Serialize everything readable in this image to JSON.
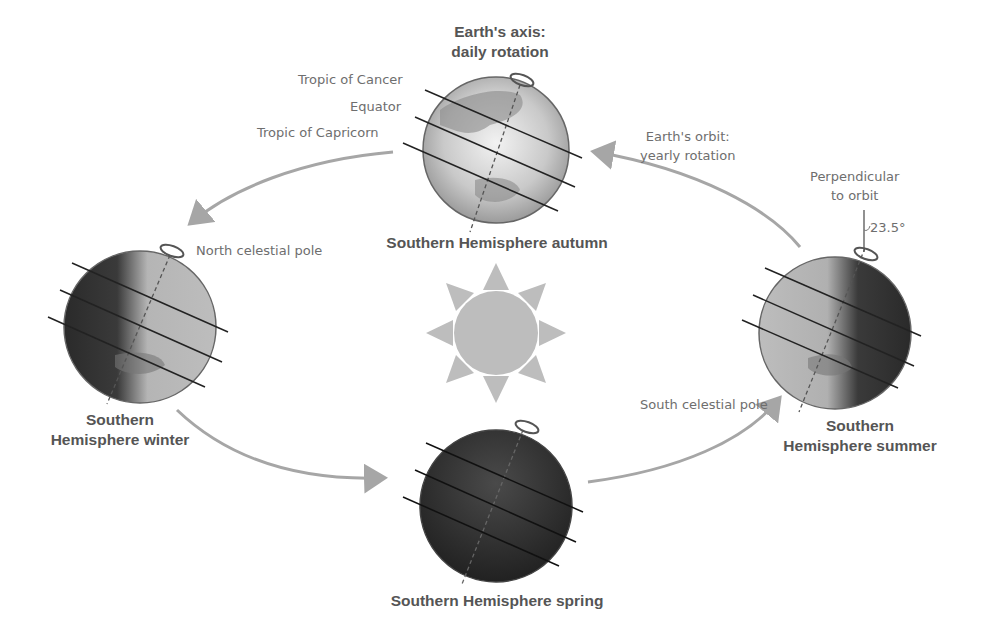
{
  "diagram": {
    "title_axis": [
      "Earth's axis:",
      "daily rotation"
    ],
    "orbit_label": [
      "Earth's orbit:",
      "yearly rotation"
    ],
    "perpendicular_label": [
      "Perpendicular",
      "to orbit"
    ],
    "tilt_angle": "23.5°",
    "latitude_labels": {
      "tropic_cancer": "Tropic of Cancer",
      "equator": "Equator",
      "tropic_capricorn": "Tropic of Capricorn"
    },
    "pole_labels": {
      "north": "North celestial pole",
      "south": "South celestial pole"
    },
    "seasons": {
      "autumn": "Southern Hemisphere autumn",
      "winter": [
        "Southern",
        "Hemisphere winter"
      ],
      "spring": "Southern Hemisphere spring",
      "summer": [
        "Southern",
        "Hemisphere summer"
      ]
    },
    "center_body": "sun",
    "colors": {
      "text": "#6e6e6e",
      "bold_text": "#555555",
      "orbit_arrow": "#a6a6a6",
      "sun": "#bdbdbd",
      "globe_dark": "#2e2e2e",
      "globe_light": "#c8c8c8"
    }
  }
}
